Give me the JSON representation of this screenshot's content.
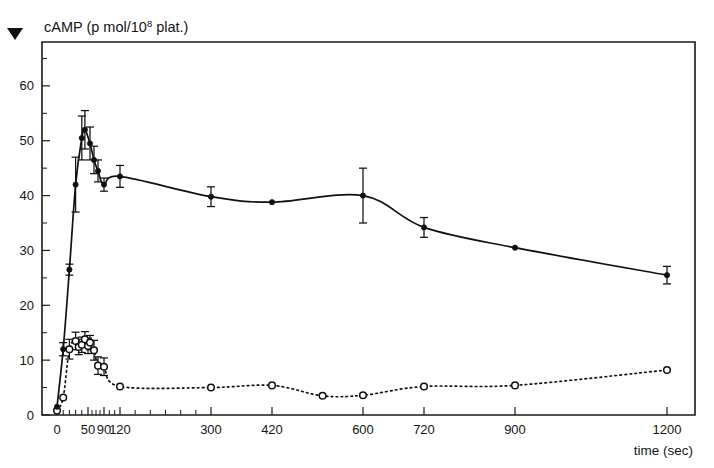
{
  "figure": {
    "marker_glyph": "▼",
    "marker_name": "down-triangle-bullet"
  },
  "chart_data": {
    "type": "line",
    "title_parts": {
      "main": "cAMP (p mol/10",
      "superscript": "8",
      "tail": " plat.)"
    },
    "xlabel": "time (sec)",
    "ylabel": "cAMP (p mol/10^8 plat.)",
    "xlim": [
      0,
      1200
    ],
    "ylim": [
      0,
      68
    ],
    "grid": false,
    "legend": "none",
    "xticks": [
      0,
      50,
      90,
      120,
      300,
      420,
      600,
      720,
      900,
      1200
    ],
    "xtick_labels": [
      "0",
      "50",
      "90",
      "120",
      "300",
      "420",
      "600",
      "720",
      "900",
      "1200"
    ],
    "x_minor_ticks": [
      10,
      20,
      30,
      40,
      60,
      70,
      80,
      100,
      110,
      150,
      180,
      210,
      240,
      270
    ],
    "yticks": [
      0,
      10,
      20,
      30,
      40,
      50,
      60
    ],
    "ytick_labels": [
      "0",
      "10",
      "20",
      "30",
      "40",
      "50",
      "60"
    ],
    "y_minor_ticks": [
      5,
      15,
      25,
      35,
      45,
      55,
      65
    ],
    "series": [
      {
        "name": "stimulated cAMP (filled circles, solid line)",
        "marker": "filled-circle",
        "linestyle": "solid",
        "x": [
          0,
          10,
          20,
          30,
          40,
          45,
          55,
          65,
          75,
          90,
          120,
          300,
          420,
          600,
          720,
          900,
          1200
        ],
        "values": [
          1.5,
          12.0,
          26.5,
          42.0,
          50.5,
          52.0,
          49.5,
          46.5,
          44.5,
          42.0,
          43.5,
          39.8,
          38.8,
          40.0,
          34.2,
          30.5,
          25.5
        ],
        "errors": [
          0.0,
          1.2,
          1.0,
          5.0,
          4.0,
          3.5,
          3.0,
          2.5,
          2.0,
          1.2,
          2.0,
          1.8,
          0.0,
          5.0,
          1.8,
          0.0,
          1.6
        ]
      },
      {
        "name": "basal cAMP (open circles, dashed line)",
        "marker": "open-circle",
        "linestyle": "dashed",
        "x": [
          0,
          10,
          20,
          30,
          35,
          40,
          45,
          50,
          55,
          65,
          75,
          90,
          120,
          300,
          420,
          520,
          600,
          720,
          900,
          1200
        ],
        "values": [
          0.8,
          3.2,
          12.0,
          13.5,
          12.4,
          12.8,
          13.8,
          12.6,
          13.2,
          11.8,
          9.0,
          8.8,
          5.2,
          5.0,
          5.4,
          3.5,
          3.6,
          5.2,
          5.4,
          8.2
        ],
        "errors": [
          0.0,
          0.0,
          1.8,
          1.6,
          1.4,
          1.4,
          1.4,
          1.4,
          1.3,
          1.8,
          1.6,
          1.6,
          0.0,
          0.0,
          0.0,
          0.0,
          0.0,
          0.0,
          0.0,
          0.0
        ]
      }
    ]
  }
}
